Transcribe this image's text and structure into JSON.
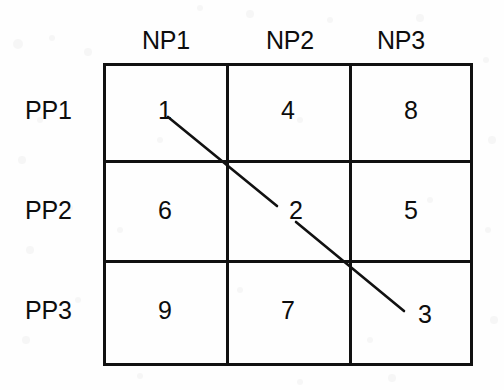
{
  "figure": {
    "line_color": "#111111",
    "text_color": "#0d0d0d",
    "background": "#fefefe"
  },
  "grid": {
    "column_headers": [
      "NP1",
      "NP2",
      "NP3"
    ],
    "row_headers": [
      "PP1",
      "PP2",
      "PP3"
    ],
    "rows": [
      [
        "1",
        "4",
        "8"
      ],
      [
        "6",
        "2",
        "5"
      ],
      [
        "9",
        "7",
        "3"
      ]
    ]
  },
  "connector": {
    "description": "diagonal line linking cells 1, 2 and 3",
    "linked_values": [
      "1",
      "2",
      "3"
    ],
    "segments": [
      {
        "x1": 168,
        "y1": 117,
        "x2": 277,
        "y2": 206
      },
      {
        "x1": 296,
        "y1": 222,
        "x2": 404,
        "y2": 311
      }
    ]
  },
  "chart_data": {
    "type": "table",
    "categories": [
      "NP1",
      "NP2",
      "NP3"
    ],
    "row_labels": [
      "PP1",
      "PP2",
      "PP3"
    ],
    "values": [
      [
        1,
        4,
        8
      ],
      [
        6,
        2,
        5
      ],
      [
        9,
        7,
        3
      ]
    ],
    "xlabel": "",
    "ylabel": "",
    "annotations": [
      {
        "text": "diagonal line",
        "from": "PP1/NP1 = 1",
        "through": "PP2/NP2 = 2",
        "to": "PP3/NP3 = 3"
      }
    ],
    "grid": true,
    "legend": "none"
  }
}
